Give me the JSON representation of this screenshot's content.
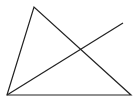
{
  "diagram": {
    "type": "geometry",
    "background": "#ffffff",
    "stroke": "#222222",
    "stroke_width": 1.2,
    "triangle": {
      "vertices": [
        {
          "name": "bottom-left",
          "x": 7,
          "y": 95
        },
        {
          "name": "top",
          "x": 34,
          "y": 7
        },
        {
          "name": "bottom-right",
          "x": 131,
          "y": 95
        }
      ]
    },
    "segment": {
      "from": {
        "x": 7,
        "y": 95
      },
      "to": {
        "x": 123,
        "y": 23
      }
    }
  }
}
